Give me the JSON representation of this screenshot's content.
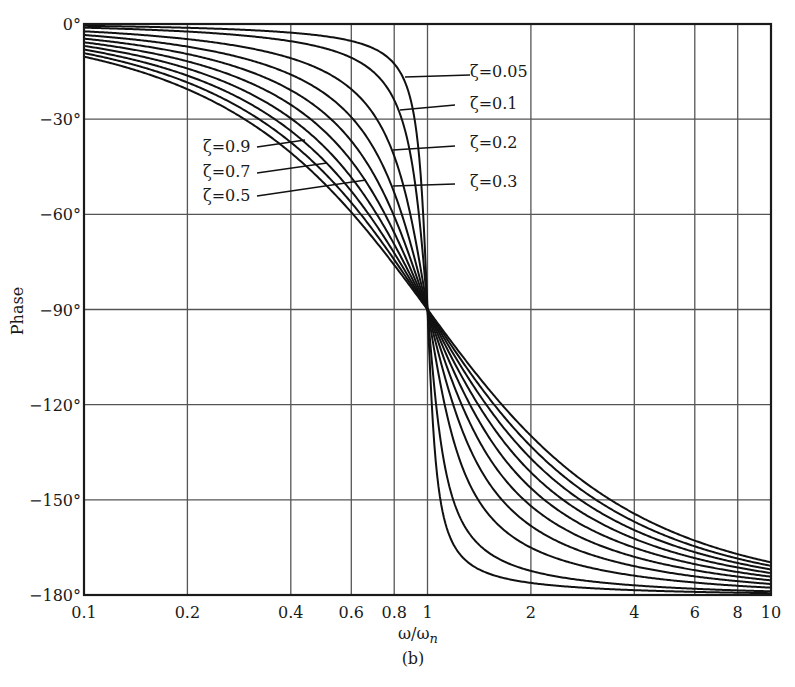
{
  "chart_data": {
    "type": "line",
    "title": "",
    "subtitle": "(b)",
    "xlabel": "ω/ω_n",
    "ylabel": "Phase",
    "xscale": "log",
    "xlim": [
      0.1,
      10
    ],
    "ylim": [
      -180,
      0
    ],
    "grid": true,
    "legend_position": "inline annotations",
    "x_ticks": [
      0.1,
      0.2,
      0.4,
      0.6,
      0.8,
      1,
      2,
      4,
      6,
      8,
      10
    ],
    "x_tick_labels": [
      "0.1",
      "0.2",
      "0.4",
      "0.6",
      "0.8",
      "1",
      "2",
      "4",
      "6",
      "8",
      "10"
    ],
    "y_ticks": [
      0,
      -30,
      -60,
      -90,
      -120,
      -150,
      -180
    ],
    "y_tick_labels": [
      "0°",
      "−30°",
      "−60°",
      "−90°",
      "−120°",
      "−150°",
      "−180°"
    ],
    "x": [
      0.1,
      0.2,
      0.4,
      0.6,
      0.8,
      1,
      2,
      4,
      6,
      8,
      10
    ],
    "series": [
      {
        "name": "ζ=0.05",
        "zeta": 0.05,
        "values": [
          -0.6,
          -1.2,
          -2.7,
          -5.4,
          -12.5,
          -90,
          -176.2,
          -178.5,
          -179.0,
          -179.3,
          -179.4
        ]
      },
      {
        "name": "ζ=0.1",
        "zeta": 0.1,
        "values": [
          -1.2,
          -2.4,
          -5.4,
          -10.6,
          -24.0,
          -90,
          -172.4,
          -177.0,
          -178.0,
          -178.5,
          -178.8
        ]
      },
      {
        "name": "ζ=0.2",
        "zeta": 0.2,
        "values": [
          -2.3,
          -4.8,
          -10.8,
          -20.6,
          -41.6,
          -90,
          -165.1,
          -174.0,
          -176.1,
          -177.1,
          -177.7
        ]
      },
      {
        "name": "ζ=0.3",
        "zeta": 0.3,
        "values": [
          -3.5,
          -7.1,
          -15.9,
          -29.4,
          -53.1,
          -90,
          -158.2,
          -171.0,
          -174.1,
          -175.6,
          -176.5
        ]
      },
      {
        "name": "ζ=0.4",
        "zeta": 0.4,
        "values": [
          -4.6,
          -9.5,
          -20.9,
          -36.9,
          -60.6,
          -90,
          -151.9,
          -168.1,
          -172.2,
          -174.2,
          -175.4
        ]
      },
      {
        "name": "ζ=0.5",
        "zeta": 0.5,
        "values": [
          -5.8,
          -11.8,
          -25.5,
          -43.2,
          -65.8,
          -90,
          -146.3,
          -165.1,
          -170.3,
          -172.8,
          -174.2
        ]
      },
      {
        "name": "ζ=0.6",
        "zeta": 0.6,
        "values": [
          -6.9,
          -14.0,
          -29.7,
          -48.4,
          -69.4,
          -90,
          -141.3,
          -162.3,
          -168.4,
          -171.3,
          -173.1
        ]
      },
      {
        "name": "ζ=0.7",
        "zeta": 0.7,
        "values": [
          -8.0,
          -16.3,
          -33.7,
          -52.7,
          -72.1,
          -90,
          -137.0,
          -159.5,
          -166.5,
          -169.9,
          -171.9
        ]
      },
      {
        "name": "ζ=0.8",
        "zeta": 0.8,
        "values": [
          -9.2,
          -18.4,
          -37.3,
          -56.3,
          -74.2,
          -90,
          -133.2,
          -156.8,
          -164.7,
          -168.5,
          -170.8
        ]
      },
      {
        "name": "ζ=0.9",
        "zeta": 0.9,
        "values": [
          -10.3,
          -20.6,
          -40.6,
          -59.4,
          -75.9,
          -90,
          -129.8,
          -154.2,
          -162.8,
          -167.1,
          -169.7
        ]
      }
    ],
    "annotations": [
      {
        "text": "ζ=0.05",
        "label_x": 470,
        "label_y": 77,
        "line": [
          [
            470,
            75
          ],
          [
            405,
            77
          ]
        ]
      },
      {
        "text": "ζ=0.1",
        "label_x": 470,
        "label_y": 109,
        "line": [
          [
            455,
            105
          ],
          [
            400,
            110
          ]
        ]
      },
      {
        "text": "ζ=0.2",
        "label_x": 470,
        "label_y": 148,
        "line": [
          [
            455,
            146
          ],
          [
            393,
            150
          ]
        ]
      },
      {
        "text": "ζ=0.3",
        "label_x": 470,
        "label_y": 187,
        "line": [
          [
            455,
            184
          ],
          [
            393,
            186
          ]
        ]
      },
      {
        "text": "ζ=0.9",
        "label_x": 203,
        "label_y": 152,
        "line": [
          [
            257,
            147
          ],
          [
            305,
            140
          ]
        ]
      },
      {
        "text": "ζ=0.7",
        "label_x": 203,
        "label_y": 177,
        "line": [
          [
            257,
            173
          ],
          [
            327,
            163
          ]
        ]
      },
      {
        "text": "ζ=0.5",
        "label_x": 203,
        "label_y": 201,
        "line": [
          [
            257,
            196
          ],
          [
            366,
            180
          ]
        ]
      }
    ]
  },
  "caption": "(b)",
  "xlabel_main": "ω/ω",
  "xlabel_sub": "n"
}
